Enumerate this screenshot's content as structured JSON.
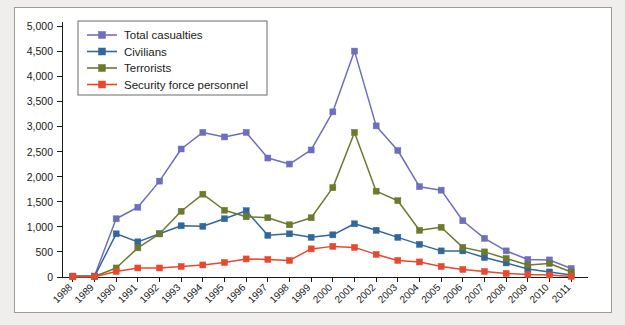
{
  "chart_data": {
    "type": "line",
    "title": "",
    "subtitle": "",
    "xlabel": "",
    "ylabel": "",
    "xlim": [
      1988,
      2011
    ],
    "ylim": [
      0,
      5000
    ],
    "grid": false,
    "legend_position": "top-left",
    "x": [
      1988,
      1989,
      1990,
      1991,
      1992,
      1993,
      1994,
      1995,
      1996,
      1997,
      1998,
      1999,
      2000,
      2001,
      2002,
      2003,
      2004,
      2005,
      2006,
      2007,
      2008,
      2009,
      2010,
      2011
    ],
    "x_tick_labels": [
      "1988",
      "1989",
      "1990",
      "1991",
      "1992",
      "1993",
      "1994",
      "1995",
      "1996",
      "1997",
      "1998",
      "1999",
      "2000",
      "2001",
      "2002",
      "2003",
      "2004",
      "2005",
      "2006",
      "2007",
      "2008",
      "2009",
      "2010",
      "2011"
    ],
    "y_tick_labels": [
      "0",
      "500",
      "1,000",
      "1,500",
      "2,000",
      "2,500",
      "3,000",
      "3,500",
      "4,000",
      "4,500",
      "5,000"
    ],
    "y_ticks": [
      0,
      500,
      1000,
      1500,
      2000,
      2500,
      3000,
      3500,
      4000,
      4500,
      5000
    ],
    "series": [
      {
        "name": "Total casualties",
        "color": "#6e6ec0",
        "marker": "square",
        "values": [
          20,
          20,
          1160,
          1390,
          1910,
          2550,
          2880,
          2790,
          2880,
          2370,
          2250,
          2530,
          3290,
          4500,
          3010,
          2520,
          1800,
          1730,
          1120,
          770,
          520,
          350,
          340,
          170
        ]
      },
      {
        "name": "Civilians",
        "color": "#31679c",
        "marker": "square",
        "values": [
          10,
          10,
          860,
          700,
          860,
          1020,
          1010,
          1160,
          1320,
          830,
          860,
          790,
          840,
          1060,
          930,
          790,
          650,
          520,
          520,
          390,
          280,
          160,
          100,
          40
        ]
      },
      {
        "name": "Terrorists",
        "color": "#6c7a2e",
        "marker": "square",
        "values": [
          10,
          10,
          180,
          580,
          860,
          1310,
          1650,
          1330,
          1200,
          1180,
          1040,
          1180,
          1780,
          2880,
          1710,
          1520,
          930,
          990,
          590,
          500,
          370,
          240,
          270,
          100
        ]
      },
      {
        "name": "Security force personnel",
        "color": "#e8492e",
        "marker": "square",
        "values": [
          5,
          5,
          110,
          180,
          180,
          210,
          240,
          290,
          360,
          350,
          330,
          560,
          610,
          590,
          450,
          330,
          300,
          210,
          150,
          110,
          70,
          50,
          40,
          10
        ]
      }
    ]
  },
  "legend": {
    "items": [
      {
        "label": "Total casualties"
      },
      {
        "label": "Civilians"
      },
      {
        "label": "Terrorists"
      },
      {
        "label": "Security force personnel"
      }
    ]
  }
}
